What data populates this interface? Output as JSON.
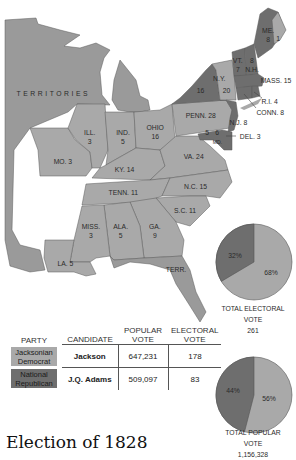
{
  "title": "Election of 1828",
  "colors": {
    "jackson": "#a9a9a9",
    "adams": "#6e6e6e",
    "territory": "#9a9a9a",
    "background": "#ffffff"
  },
  "map": {
    "regions": [
      {
        "id": "territories",
        "label": "TERRITORIES",
        "party": "territory"
      },
      {
        "id": "me",
        "label": "ME.\n8",
        "votes": 8,
        "party": "adams"
      },
      {
        "id": "me-split",
        "label": "1",
        "votes": 1,
        "party": "jackson"
      },
      {
        "id": "vt",
        "label": "VT.\n7",
        "votes": 7,
        "party": "adams"
      },
      {
        "id": "nh",
        "label": "8\nN.H.",
        "votes": 8,
        "party": "adams"
      },
      {
        "id": "mass",
        "label": "MASS. 15",
        "votes": 15,
        "party": "adams"
      },
      {
        "id": "ri",
        "label": "R.I. 4",
        "votes": 4,
        "party": "adams"
      },
      {
        "id": "conn",
        "label": "CONN. 8",
        "votes": 8,
        "party": "adams"
      },
      {
        "id": "ny-adams",
        "label": "16",
        "votes": 16,
        "party": "adams"
      },
      {
        "id": "ny-jackson",
        "label": "20",
        "votes": 20,
        "party": "jackson"
      },
      {
        "id": "ny-name",
        "label": "N.Y.",
        "party": "none"
      },
      {
        "id": "nj",
        "label": "N.J. 8",
        "votes": 8,
        "party": "adams"
      },
      {
        "id": "del",
        "label": "DEL. 3",
        "votes": 3,
        "party": "adams"
      },
      {
        "id": "md-jackson",
        "label": "5",
        "votes": 5,
        "party": "jackson"
      },
      {
        "id": "md-adams",
        "label": "6",
        "votes": 6,
        "party": "adams"
      },
      {
        "id": "md-name",
        "label": "MD.",
        "party": "none"
      },
      {
        "id": "penn",
        "label": "PENN. 28",
        "votes": 28,
        "party": "jackson"
      },
      {
        "id": "ohio",
        "label": "OHIO\n16",
        "votes": 16,
        "party": "jackson"
      },
      {
        "id": "ind",
        "label": "IND.\n5",
        "votes": 5,
        "party": "jackson"
      },
      {
        "id": "ill",
        "label": "ILL.\n3",
        "votes": 3,
        "party": "jackson"
      },
      {
        "id": "mo",
        "label": "MO. 3",
        "votes": 3,
        "party": "jackson"
      },
      {
        "id": "ky",
        "label": "KY. 14",
        "votes": 14,
        "party": "jackson"
      },
      {
        "id": "va",
        "label": "VA. 24",
        "votes": 24,
        "party": "jackson"
      },
      {
        "id": "tenn",
        "label": "TENN. 11",
        "votes": 11,
        "party": "jackson"
      },
      {
        "id": "nc",
        "label": "N.C. 15",
        "votes": 15,
        "party": "jackson"
      },
      {
        "id": "sc",
        "label": "S.C. 11",
        "votes": 11,
        "party": "jackson"
      },
      {
        "id": "ga",
        "label": "GA.\n9",
        "votes": 9,
        "party": "jackson"
      },
      {
        "id": "ala",
        "label": "ALA.\n5",
        "votes": 5,
        "party": "jackson"
      },
      {
        "id": "miss",
        "label": "MISS.\n3",
        "votes": 3,
        "party": "jackson"
      },
      {
        "id": "la",
        "label": "LA. 5",
        "votes": 5,
        "party": "jackson"
      },
      {
        "id": "fl-terr",
        "label": "TERR.",
        "party": "territory"
      }
    ]
  },
  "electoral_pie": {
    "slices": [
      {
        "party": "Jacksonian Democrat",
        "pct": 68,
        "label": "68%"
      },
      {
        "party": "National Republican",
        "pct": 32,
        "label": "32%"
      }
    ],
    "caption": "TOTAL ELECTORAL VOTE",
    "total": "261"
  },
  "popular_pie": {
    "slices": [
      {
        "party": "Jacksonian Democrat",
        "pct": 56,
        "label": "56%"
      },
      {
        "party": "National Republican",
        "pct": 44,
        "label": "44%"
      }
    ],
    "caption": "TOTAL POPULAR VOTE",
    "total": "1,156,328"
  },
  "table": {
    "headers": {
      "party": "PARTY",
      "candidate": "CANDIDATE",
      "popular": "POPULAR\nVOTE",
      "electoral": "ELECTORAL\nVOTE"
    },
    "rows": [
      {
        "party": "Jacksonian\nDemocrat",
        "candidate": "Jackson",
        "popular": "647,231",
        "electoral": "178"
      },
      {
        "party": "National\nRepublican",
        "candidate": "J.Q. Adams",
        "popular": "509,097",
        "electoral": "83"
      }
    ]
  }
}
